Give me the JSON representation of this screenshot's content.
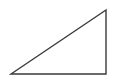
{
  "diagram": {
    "shape": "right-triangle",
    "stroke_color": "#3a3a3a",
    "fill_color": "none",
    "background": "#ffffff",
    "vertices": [
      [
        11,
        74
      ],
      [
        106,
        10
      ],
      [
        106,
        74
      ]
    ],
    "points": "11,74 106,10 106,74"
  }
}
